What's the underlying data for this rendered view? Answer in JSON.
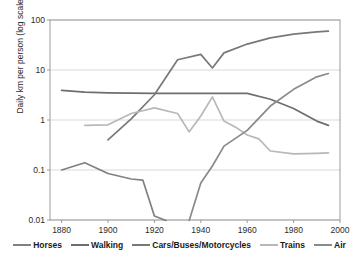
{
  "chart_data": {
    "type": "line",
    "title": "",
    "subtitle": "",
    "xlabel": "",
    "ylabel": "Daily km per person (log scale)",
    "xlim": [
      1875,
      2000
    ],
    "ylim": [
      0.01,
      100
    ],
    "yscale": "log",
    "grid": true,
    "grid_axis": "y",
    "legend_position": "bottom",
    "xticks": [
      1880,
      1900,
      1920,
      1940,
      1960,
      1980,
      2000
    ],
    "yticks": [
      0.01,
      0.1,
      1,
      10,
      100
    ],
    "ytick_labels": [
      "0.01",
      "0.1",
      "1",
      "10",
      "100"
    ],
    "series": [
      {
        "name": "Horses",
        "color": "#808080",
        "x": [
          1880,
          1890,
          1900,
          1910,
          1915,
          1920,
          1925
        ],
        "values": [
          0.1,
          0.14,
          0.085,
          0.066,
          0.063,
          0.012,
          0.0098
        ]
      },
      {
        "name": "Walking",
        "color": "#6e6e6e",
        "x": [
          1880,
          1890,
          1900,
          1910,
          1920,
          1930,
          1940,
          1950,
          1960,
          1970,
          1980,
          1990,
          1995
        ],
        "values": [
          3.9,
          3.6,
          3.5,
          3.45,
          3.42,
          3.4,
          3.4,
          3.4,
          3.4,
          2.6,
          1.7,
          0.95,
          0.78
        ]
      },
      {
        "name": "Cars/Buses/Motorcycles",
        "color": "#787878",
        "x": [
          1900,
          1910,
          1920,
          1930,
          1940,
          1945,
          1950,
          1960,
          1970,
          1980,
          1990,
          1995
        ],
        "values": [
          0.4,
          1.05,
          3.2,
          16,
          20.5,
          11,
          22,
          33,
          44,
          52,
          58,
          60
        ]
      },
      {
        "name": "Trains",
        "color": "#b8b8b8",
        "x": [
          1890,
          1900,
          1910,
          1920,
          1930,
          1935,
          1940,
          1945,
          1950,
          1955,
          1960,
          1965,
          1970,
          1980,
          1990,
          1995
        ],
        "values": [
          0.78,
          0.8,
          1.35,
          1.75,
          1.35,
          0.58,
          1.2,
          2.9,
          0.95,
          0.72,
          0.5,
          0.42,
          0.24,
          0.21,
          0.215,
          0.22
        ]
      },
      {
        "name": "Air",
        "color": "#8a8a8a",
        "x": [
          1935,
          1940,
          1945,
          1950,
          1960,
          1970,
          1980,
          1990,
          1995
        ],
        "values": [
          0.0098,
          0.055,
          0.12,
          0.3,
          0.62,
          1.9,
          4.1,
          7.3,
          8.5
        ]
      }
    ]
  },
  "axis": {
    "y_label": "Daily km per person (log scale)",
    "y_tick_labels": [
      "100",
      "10",
      "1",
      "0.1",
      "0.01"
    ],
    "x_tick_labels": [
      "1880",
      "1900",
      "1920",
      "1940",
      "1960",
      "1980",
      "2000"
    ]
  },
  "legend": {
    "items": [
      {
        "label": "Horses",
        "color": "#808080"
      },
      {
        "label": "Walking",
        "color": "#6e6e6e"
      },
      {
        "label": "Cars/Buses/Motorcycles",
        "color": "#787878"
      },
      {
        "label": "Trains",
        "color": "#b8b8b8"
      },
      {
        "label": "Air",
        "color": "#8a8a8a"
      }
    ]
  },
  "colors": {
    "plot_border": "#9b9b9b",
    "gridline": "#d9d9d9",
    "text": "#2b2b2b",
    "background": "#ffffff"
  }
}
